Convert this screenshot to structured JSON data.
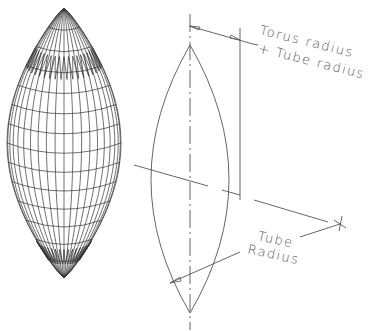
{
  "figure": {
    "type": "technical-drawing",
    "left_view": {
      "name": "wireframe-mesh-lens",
      "meridians": 20,
      "parallels": 14
    },
    "right_view": {
      "name": "outline-lens-with-dimensions"
    }
  },
  "labels": {
    "torus_plus_tube_line1": "Torus radius",
    "torus_plus_tube_line2": "+ Tube radius",
    "tube_radius_line1": "Tube",
    "tube_radius_line2": "Radius"
  },
  "colors": {
    "line": "#555555",
    "mesh": "#333333",
    "background": "#ffffff"
  }
}
